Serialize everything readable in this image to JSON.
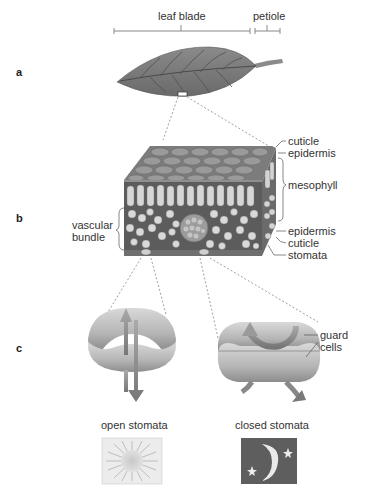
{
  "panels": {
    "a": "a",
    "b": "b",
    "c": "c"
  },
  "panel_a": {
    "labels": {
      "leaf_blade": "leaf blade",
      "petiole": "petiole"
    }
  },
  "panel_b": {
    "labels": {
      "cuticle_top": "cuticle",
      "epidermis_top": "epidermis",
      "mesophyll": "mesophyll",
      "epidermis_bottom": "epidermis",
      "cuticle_bottom": "cuticle",
      "stomata": "stomata",
      "vascular_bundle_line1": "vascular",
      "vascular_bundle_line2": "bundle"
    }
  },
  "panel_c": {
    "labels": {
      "guard_cells_line1": "guard",
      "guard_cells_line2": "cells",
      "open_stomata": "open stomata",
      "closed_stomata": "closed stomata"
    },
    "icons": {
      "open": "sun-icon",
      "closed": "moon-stars-icon"
    }
  },
  "colors": {
    "leaf": "#7a7a7a",
    "vein": "#4a4a4a",
    "tissue_dark": "#5a5a5a",
    "tissue_light": "#d8d8d8",
    "guard_cell": "#bdbdbd",
    "night_bg": "#5e5e5e",
    "day_bg": "#e8e8e8"
  }
}
